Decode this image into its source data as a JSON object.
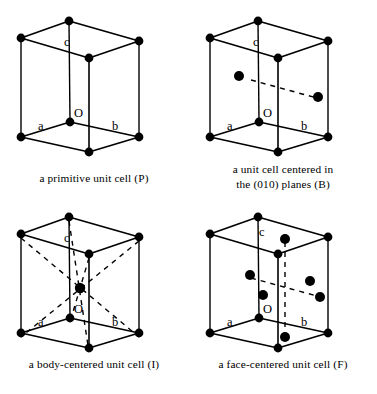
{
  "figure": {
    "line_color": "#000000",
    "dot_color": "#000000",
    "background": "#ffffff"
  },
  "axis_labels": {
    "a": "a",
    "b": "b",
    "c": "c",
    "origin": "O"
  },
  "cells": [
    {
      "id": "primitive",
      "symbol": "P",
      "caption_lines": [
        "a primitive unit cell (P)"
      ],
      "lattice_point_count": 8,
      "interior_points": 0
    },
    {
      "id": "b-centered",
      "symbol": "B",
      "caption_lines": [
        "a unit cell centered in",
        "the (010) planes (B)"
      ],
      "lattice_point_count": 8,
      "interior_points": 2
    },
    {
      "id": "body-centered",
      "symbol": "I",
      "caption_lines": [
        "a body-centered unit cell (I)"
      ],
      "lattice_point_count": 8,
      "interior_points": 1
    },
    {
      "id": "face-centered",
      "symbol": "F",
      "caption_lines": [
        "a face-centered unit cell (F)"
      ],
      "lattice_point_count": 8,
      "interior_points": 6
    }
  ]
}
